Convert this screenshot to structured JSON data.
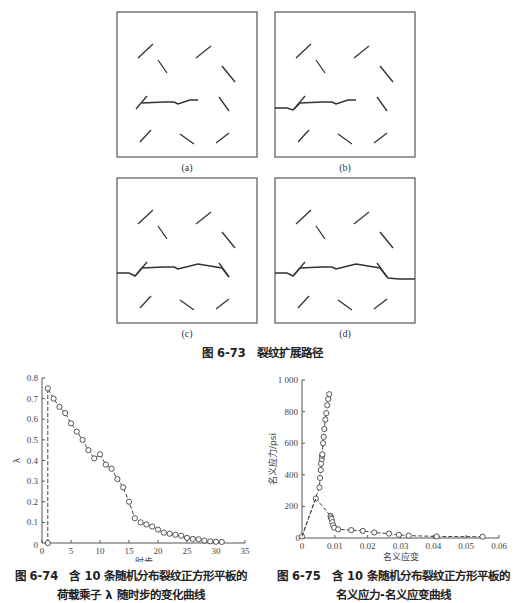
{
  "figure_673": {
    "caption": "图 6-73　裂纹扩展路径",
    "panels": [
      {
        "label": "(a)",
        "stage": "crack grows from central microcrack only"
      },
      {
        "label": "(b)",
        "stage": "crack reaches left edge"
      },
      {
        "label": "(c)",
        "stage": "crack extends to right microcrack"
      },
      {
        "label": "(d)",
        "stage": "crack spans full plate width"
      }
    ]
  },
  "figure_674": {
    "caption_line1": "图 6-74　含 10 条随机分布裂纹正方形平板的",
    "caption_line2": "荷载乘子 λ 随时步的变化曲线"
  },
  "figure_675": {
    "caption_line1": "图 6-75　含 10 条随机分布裂纹正方形平板的",
    "caption_line2": "名义应力-名义应变曲线"
  },
  "chart_data": [
    {
      "type": "line",
      "title": "荷载乘子 λ 随时步的变化曲线",
      "xlabel": "时步",
      "ylabel": "λ",
      "xlim": [
        0,
        35
      ],
      "ylim": [
        0,
        0.8
      ],
      "xticks": [
        0,
        5,
        10,
        15,
        20,
        25,
        30,
        35
      ],
      "yticks": [
        0.1,
        0.2,
        0.3,
        0.4,
        0.5,
        0.6,
        0.7,
        0.8
      ],
      "grid": false,
      "marker": "circle",
      "linestyle": "dashed",
      "x": [
        1,
        1,
        2,
        3,
        4,
        5,
        6,
        7,
        8,
        9,
        10,
        11,
        12,
        13,
        14,
        15,
        16,
        17,
        18,
        19,
        20,
        21,
        22,
        23,
        24,
        25,
        26,
        27,
        28,
        29,
        30,
        31
      ],
      "y": [
        0.0,
        0.75,
        0.7,
        0.66,
        0.63,
        0.58,
        0.54,
        0.5,
        0.45,
        0.41,
        0.43,
        0.38,
        0.36,
        0.31,
        0.27,
        0.2,
        0.12,
        0.1,
        0.09,
        0.08,
        0.065,
        0.05,
        0.045,
        0.04,
        0.035,
        0.025,
        0.02,
        0.018,
        0.012,
        0.008,
        0.006,
        0.005
      ]
    },
    {
      "type": "line",
      "title": "名义应力-名义应变曲线",
      "xlabel": "名义应变",
      "ylabel": "名义应力/psi",
      "xlim": [
        0,
        0.06
      ],
      "ylim": [
        0,
        1000
      ],
      "xticks": [
        "0",
        "0.01",
        "0.02",
        "0.03",
        "0.04",
        "0.05",
        "0.06"
      ],
      "yticks": [
        "0",
        "200",
        "400",
        "600",
        "800",
        "1 000"
      ],
      "grid": false,
      "marker": "circle",
      "linestyle": "dashed",
      "x": [
        0.0,
        0.0053,
        0.0055,
        0.0057,
        0.0058,
        0.006,
        0.0061,
        0.0062,
        0.0064,
        0.0066,
        0.0068,
        0.0071,
        0.0074,
        0.0077,
        0.008,
        0.0083,
        0.0042,
        0.0087,
        0.0088,
        0.009,
        0.0092,
        0.0095,
        0.0098,
        0.011,
        0.015,
        0.0185,
        0.022,
        0.0265,
        0.0295,
        0.0325,
        0.041,
        0.055
      ],
      "y": [
        10,
        320,
        380,
        430,
        470,
        500,
        520,
        530,
        600,
        640,
        690,
        750,
        790,
        840,
        880,
        910,
        250,
        140,
        130,
        120,
        100,
        80,
        65,
        55,
        50,
        45,
        35,
        28,
        20,
        15,
        10,
        8
      ]
    }
  ]
}
